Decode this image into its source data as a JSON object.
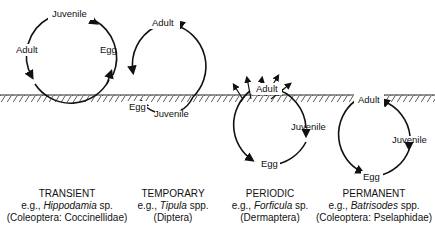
{
  "ground": {
    "y": 95
  },
  "cycles": [
    {
      "id": "transient",
      "stages": {
        "top": "Juvenile",
        "left": "Adult",
        "right": "Egg"
      },
      "caption": {
        "title": "TRANSIENT",
        "prefix": "e.g., ",
        "genus": "Hippodamia",
        "suffix": " sp.",
        "taxon": "(Coleoptera: Coccinellidae)"
      }
    },
    {
      "id": "temporary",
      "stages": {
        "top": "Adult",
        "left": "Egg",
        "bottom": "Juvenile"
      },
      "caption": {
        "title": "TEMPORARY",
        "prefix": "e.g., ",
        "genus": "Tipula",
        "suffix": " spp.",
        "taxon": "(Diptera)"
      }
    },
    {
      "id": "periodic",
      "stages": {
        "top": "Adult",
        "right": "Juvenile",
        "bottom": "Egg"
      },
      "caption": {
        "title": "PERIODIC",
        "prefix": "e.g., ",
        "genus": "Forficula",
        "suffix": " sp.",
        "taxon": "(Dermaptera)"
      }
    },
    {
      "id": "permanent",
      "stages": {
        "top": "Adult",
        "right": "Juvenile",
        "bottom": "Egg"
      },
      "caption": {
        "title": "PERMANENT",
        "prefix": "e.g., ",
        "genus": "Batrisodes",
        "suffix": " spp.",
        "taxon": "(Coleoptera: Pselaphidae)"
      }
    }
  ]
}
